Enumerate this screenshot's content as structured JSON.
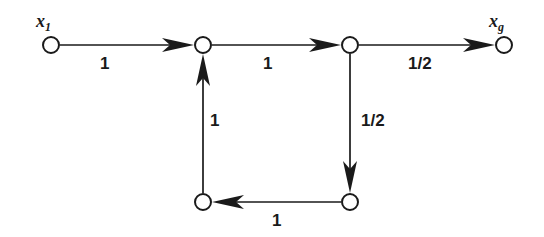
{
  "diagram": {
    "background_color": "#ffffff",
    "stroke_color": "#1a1a1a",
    "nodes": [
      {
        "id": "x1",
        "name": "start-node",
        "label_base": "x",
        "label_sub": "1",
        "cx": 51,
        "cy": 45,
        "r": 8,
        "has_label": true
      },
      {
        "id": "n2",
        "name": "junction-node-top-left",
        "label_base": "",
        "label_sub": "",
        "cx": 203,
        "cy": 45,
        "r": 8,
        "has_label": false
      },
      {
        "id": "n3",
        "name": "junction-node-top-right",
        "label_base": "",
        "label_sub": "",
        "cx": 350,
        "cy": 45,
        "r": 8,
        "has_label": false
      },
      {
        "id": "xg",
        "name": "goal-node",
        "label_base": "x",
        "label_sub": "g",
        "cx": 504,
        "cy": 45,
        "r": 8,
        "has_label": true
      },
      {
        "id": "n5",
        "name": "junction-node-bottom-left",
        "label_base": "",
        "label_sub": "",
        "cx": 203,
        "cy": 202,
        "r": 8,
        "has_label": false
      },
      {
        "id": "n6",
        "name": "junction-node-bottom-right",
        "label_base": "",
        "label_sub": "",
        "cx": 350,
        "cy": 202,
        "r": 8,
        "has_label": false
      }
    ],
    "edges": [
      {
        "id": "e1",
        "name": "edge-x1-to-n2",
        "from": "x1",
        "to": "n2",
        "weight": "1",
        "direction": "right",
        "label_x": 100,
        "label_y": 55
      },
      {
        "id": "e2",
        "name": "edge-n2-to-n3",
        "from": "n2",
        "to": "n3",
        "weight": "1",
        "direction": "right",
        "label_x": 263,
        "label_y": 55
      },
      {
        "id": "e3",
        "name": "edge-n3-to-xg",
        "from": "n3",
        "to": "xg",
        "weight": "1/2",
        "direction": "right",
        "label_x": 408,
        "label_y": 55
      },
      {
        "id": "e4",
        "name": "edge-n3-to-n6",
        "from": "n3",
        "to": "n6",
        "weight": "1/2",
        "direction": "down",
        "label_x": 361,
        "label_y": 112
      },
      {
        "id": "e5",
        "name": "edge-n6-to-n5",
        "from": "n6",
        "to": "n5",
        "weight": "1",
        "direction": "left",
        "label_x": 272,
        "label_y": 212
      },
      {
        "id": "e6",
        "name": "edge-n5-to-n2",
        "from": "n5",
        "to": "n2",
        "weight": "1",
        "direction": "up",
        "label_x": 210,
        "label_y": 112
      }
    ],
    "node_labels": [
      {
        "id": "x1",
        "base": "x",
        "sub": "1",
        "x": 36,
        "y": 12
      },
      {
        "id": "xg",
        "base": "x",
        "sub": "g",
        "x": 489,
        "y": 12
      }
    ]
  }
}
